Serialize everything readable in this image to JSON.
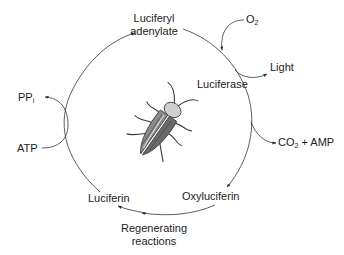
{
  "labels": {
    "luciferyl_adenylate_line1": "Luciferyl",
    "luciferyl_adenylate_line2": "adenylate",
    "o2_main": "O",
    "o2_sub": "2",
    "light": "Light",
    "luciferase": "Luciferase",
    "ppi_main": "PP",
    "ppi_sub": "i",
    "atp": "ATP",
    "co2amp_main": "CO",
    "co2amp_sub": "2",
    "co2amp_rest": " + AMP",
    "oxyluciferin": "Oxyluciferin",
    "luciferin": "Luciferin",
    "regenerating_line1": "Regenerating",
    "regenerating_line2": "reactions"
  },
  "colors": {
    "line": "#333333",
    "text": "#222222",
    "beetle_dark": "#3a3a3a",
    "beetle_mid": "#8a8a8a",
    "beetle_light": "#d0d0d0"
  }
}
